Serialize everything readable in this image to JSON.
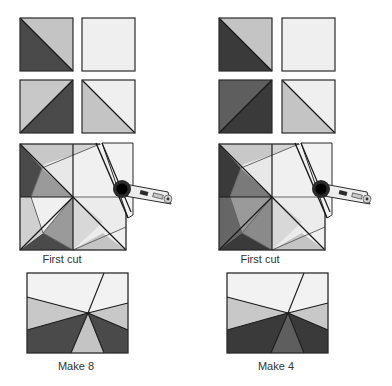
{
  "colors": {
    "outline": "#2a2a2a",
    "dark": "#4a4a4a",
    "darker": "#3a3a3a",
    "medium_dark": "#5e5e5e",
    "medium": "#9a9a9a",
    "light": "#c4c4c4",
    "lighter": "#d8d8d8",
    "pale": "#efefef",
    "seam": "#666666"
  },
  "left_panel": {
    "first_cut_label": "First cut",
    "result_label": "Make 8"
  },
  "right_panel": {
    "first_cut_label": "First cut",
    "result_label": "Make 4"
  },
  "icons": {
    "cutter": "rotary-cutter-icon"
  }
}
